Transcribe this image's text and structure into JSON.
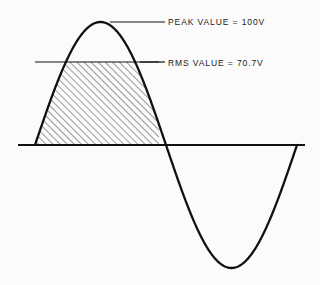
{
  "figure": {
    "background_color": "#fbfbfb",
    "ink_color": "#111111"
  },
  "annotations": [
    {
      "id": "peak",
      "text": "PEAK VALUE  =  100V",
      "quantity": "PEAK VALUE",
      "value": "100V",
      "leader_from_x": 110,
      "leader_to_x": 165,
      "leader_y": 22
    },
    {
      "id": "rms",
      "text": "RMS VALUE  =  70.7V",
      "quantity": "RMS VALUE",
      "value": "70.7V",
      "leader_from_x": 140,
      "leader_to_x": 165,
      "leader_y": 62
    }
  ],
  "chart_data": {
    "type": "line",
    "xlabel": "",
    "ylabel": "",
    "grid": false,
    "legend": "none",
    "axis": {
      "baseline_y": 145,
      "x_start": 18,
      "x_end": 305
    },
    "series": [
      {
        "name": "sine waveform",
        "waveform": "sine",
        "cycles": 1,
        "peak_amplitude_px": 123,
        "peak_value": 100,
        "peak_unit": "V",
        "rms_value": 70.7,
        "rms_unit": "V",
        "zero_crossings_x": [
          35,
          159,
          297
        ],
        "crest": {
          "x": 97,
          "y": 22
        },
        "trough": {
          "x": 232,
          "y": 268
        }
      }
    ],
    "shaded_region": {
      "name": "rms-hatched-area",
      "pattern": "diagonal-hatch",
      "hatch_angle_deg": 45,
      "hatch_spacing_px": 5,
      "top_y": 62,
      "bottom_y": 145,
      "left_x": 35,
      "right_x": 159
    },
    "rms_line": {
      "y": 62,
      "from_x": 35,
      "to_x": 159
    }
  }
}
